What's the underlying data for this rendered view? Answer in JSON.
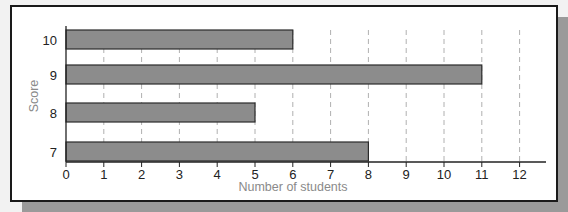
{
  "chart_data": {
    "type": "bar",
    "orientation": "horizontal",
    "title": "",
    "xlabel": "Number of students",
    "ylabel": "Score",
    "categories": [
      "10",
      "9",
      "8",
      "7"
    ],
    "values": [
      6,
      11,
      5,
      8
    ],
    "xlim": [
      0,
      12
    ],
    "x_ticks": [
      0,
      1,
      2,
      3,
      4,
      5,
      6,
      7,
      8,
      9,
      10,
      11,
      12
    ],
    "grid": "vertical dashed",
    "legend": null,
    "colors": {
      "bar": "#8c8c8c",
      "bar_edge": "#2a2a2a",
      "grid": "#b0b0b0",
      "axis": "#222222"
    }
  }
}
